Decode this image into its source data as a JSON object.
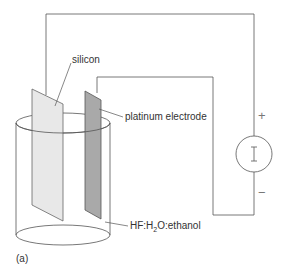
{
  "diagram": {
    "labels": {
      "silicon": "silicon",
      "platinum": "platinum electrode",
      "solution_pre": "HF:H",
      "solution_sub": "2",
      "solution_post": "O:ethanol",
      "panel": "(a)"
    },
    "source": {
      "symbol": "I",
      "plus": "+",
      "minus": "−"
    },
    "colors": {
      "line": "#555555",
      "silicon_fill": "#e6e6e6",
      "platinum_fill": "#a8a8a8"
    }
  }
}
